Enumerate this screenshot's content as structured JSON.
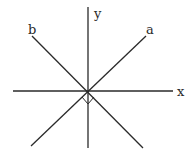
{
  "diagram": {
    "type": "coordinate-axes-with-perpendicular-lines",
    "origin": {
      "x": 88,
      "y": 91
    },
    "axes": {
      "x": {
        "label": "x",
        "from": [
          13,
          91
        ],
        "to": [
          173,
          91
        ]
      },
      "y": {
        "label": "y",
        "from": [
          88,
          148
        ],
        "to": [
          88,
          7
        ]
      }
    },
    "lines": [
      {
        "name": "a",
        "label": "a",
        "from": [
          31,
          146
        ],
        "to": [
          146,
          36
        ],
        "direction": "upper-right"
      },
      {
        "name": "b",
        "label": "b",
        "from": [
          143,
          148
        ],
        "to": [
          32,
          36
        ],
        "direction": "upper-left"
      }
    ],
    "right_angle_marker": {
      "between": [
        "a",
        "b"
      ],
      "position": "below-origin",
      "points": [
        [
          82,
          97
        ],
        [
          88,
          104
        ],
        [
          94,
          97
        ]
      ]
    },
    "labels": {
      "x": "x",
      "y": "y",
      "a": "a",
      "b": "b"
    },
    "color": "#2a2a2a"
  }
}
